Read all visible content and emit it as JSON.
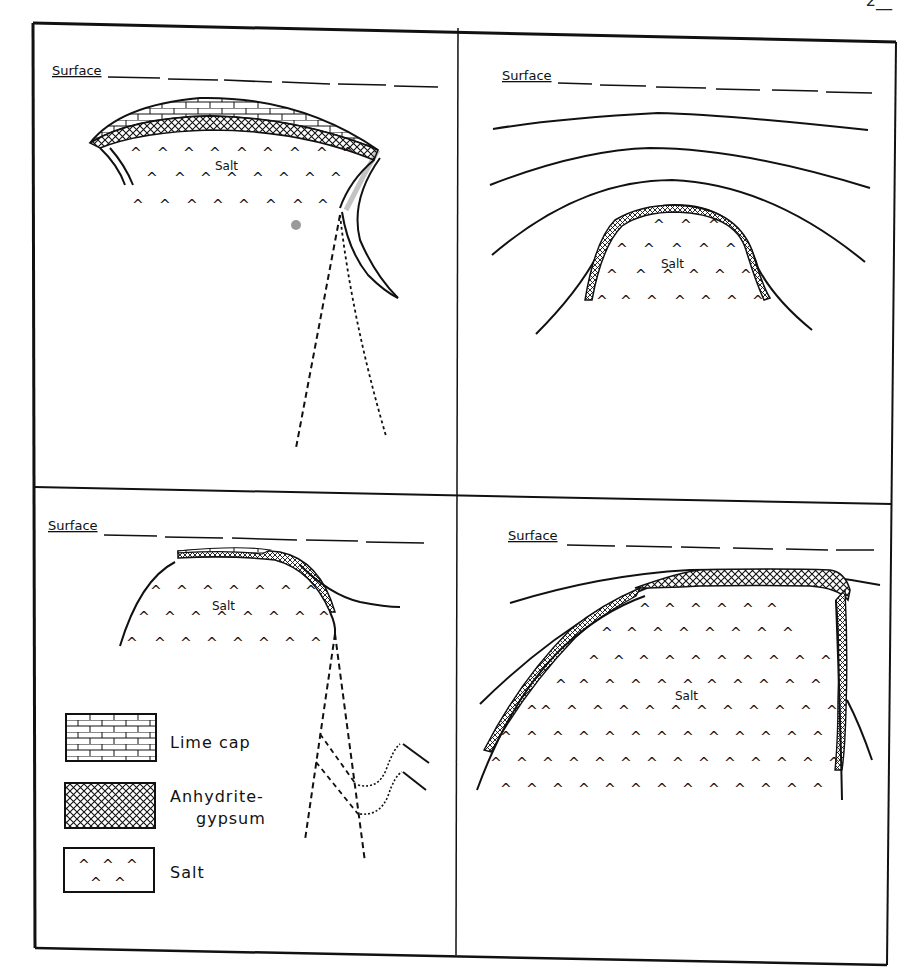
{
  "page": {
    "number_partial": "2__"
  },
  "panels": [
    {
      "id": "top-left",
      "surface_label": "Surface",
      "salt_label": "Salt"
    },
    {
      "id": "top-right",
      "surface_label": "Surface",
      "salt_label": "Salt"
    },
    {
      "id": "bottom-left",
      "surface_label": "Surface",
      "salt_label": "Salt"
    },
    {
      "id": "bottom-right",
      "surface_label": "Surface",
      "salt_label": "Salt"
    }
  ],
  "legend": {
    "items": [
      {
        "pattern": "brick",
        "label": "Lime cap"
      },
      {
        "pattern": "crosshatch",
        "label_line1": "Anhydrite-",
        "label_line2": "gypsum"
      },
      {
        "pattern": "caret",
        "label": "Salt"
      }
    ]
  },
  "colors": {
    "ink": "#111111",
    "paper": "#ffffff",
    "smudge": "#9a9a9a"
  }
}
